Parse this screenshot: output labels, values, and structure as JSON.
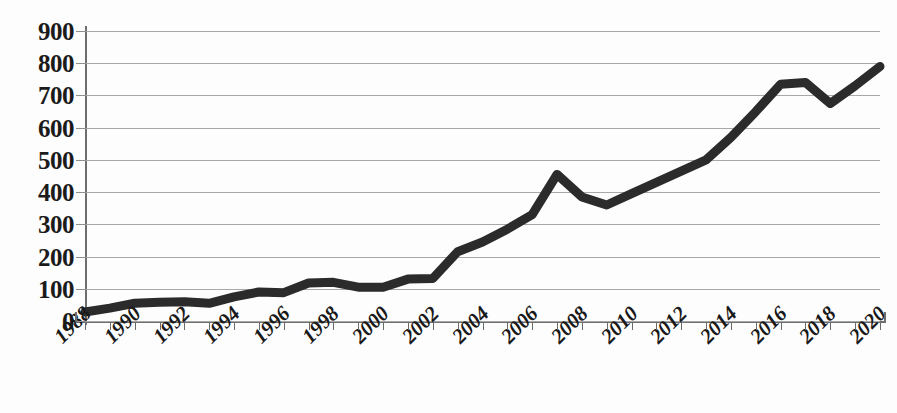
{
  "chart_data": {
    "type": "line",
    "title": "",
    "subtitle": "",
    "xlabel": "",
    "ylabel": "",
    "xlim": [
      1988,
      2020
    ],
    "ylim": [
      0,
      900
    ],
    "grid": true,
    "legend": "none",
    "y_ticks": [
      900,
      800,
      700,
      600,
      500,
      400,
      300,
      200,
      100,
      0
    ],
    "y_tick_labels": [
      "900",
      "800",
      "700",
      "600",
      "500",
      "400",
      "300",
      "200",
      "100",
      "0"
    ],
    "x_tick_labels": [
      "1988",
      "1990",
      "1992",
      "1994",
      "1996",
      "1998",
      "2000",
      "2002",
      "2004",
      "2006",
      "2008",
      "2010",
      "2012",
      "2014",
      "2016",
      "2018",
      "2020"
    ],
    "x_tick_label_step": 2,
    "x_minor_tick_step": 1,
    "line_color": "#2b2b2b",
    "grid_color": "#a8a8a8",
    "axis_color": "#6e6e6e",
    "x": [
      1988,
      1989,
      1990,
      1991,
      1992,
      1993,
      1994,
      1995,
      1996,
      1997,
      1998,
      1999,
      2000,
      2001,
      2002,
      2003,
      2004,
      2005,
      2006,
      2007,
      2008,
      2009,
      2010,
      2011,
      2012,
      2013,
      2014,
      2015,
      2016,
      2017,
      2018,
      2019,
      2020
    ],
    "series": [
      {
        "name": "value",
        "values": [
          28,
          40,
          55,
          58,
          60,
          55,
          75,
          90,
          88,
          118,
          120,
          105,
          105,
          130,
          132,
          215,
          245,
          285,
          330,
          455,
          385,
          360,
          395,
          430,
          465,
          500,
          570,
          650,
          735,
          740,
          675,
          730,
          790
        ]
      }
    ]
  }
}
